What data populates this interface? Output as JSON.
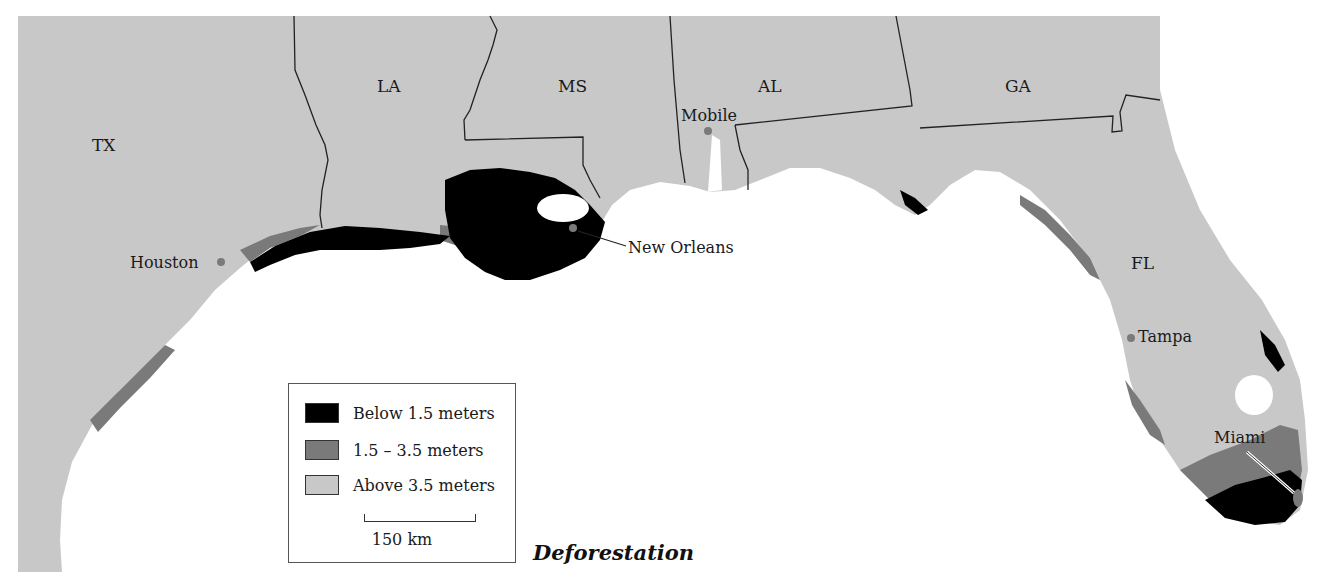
{
  "title": "Deforestation",
  "states": [
    {
      "abbr": "TX",
      "x": 92,
      "y": 135
    },
    {
      "abbr": "LA",
      "x": 377,
      "y": 76
    },
    {
      "abbr": "MS",
      "x": 558,
      "y": 76
    },
    {
      "abbr": "AL",
      "x": 758,
      "y": 76
    },
    {
      "abbr": "GA",
      "x": 1005,
      "y": 76
    },
    {
      "abbr": "FL",
      "x": 1131,
      "y": 253
    }
  ],
  "cities": [
    {
      "name": "Houston",
      "x": 130,
      "y": 253
    },
    {
      "name": "Mobile",
      "x": 681,
      "y": 106
    },
    {
      "name": "New Orleans",
      "x": 628,
      "y": 238
    },
    {
      "name": "Tampa",
      "x": 1138,
      "y": 327
    },
    {
      "name": "Miami",
      "x": 1214,
      "y": 428
    }
  ],
  "legend": {
    "items": [
      {
        "label": "Below 1.5 meters",
        "color": "#000000"
      },
      {
        "label": "1.5 – 3.5 meters",
        "color": "#7a7a7a"
      },
      {
        "label": "Above 3.5 meters",
        "color": "#c8c8c8"
      }
    ],
    "scale_label": "150 km"
  },
  "colors": {
    "land_high": "#c8c8c8",
    "land_mid": "#7a7a7a",
    "land_low": "#000000",
    "water": "#ffffff",
    "border": "#222222"
  }
}
